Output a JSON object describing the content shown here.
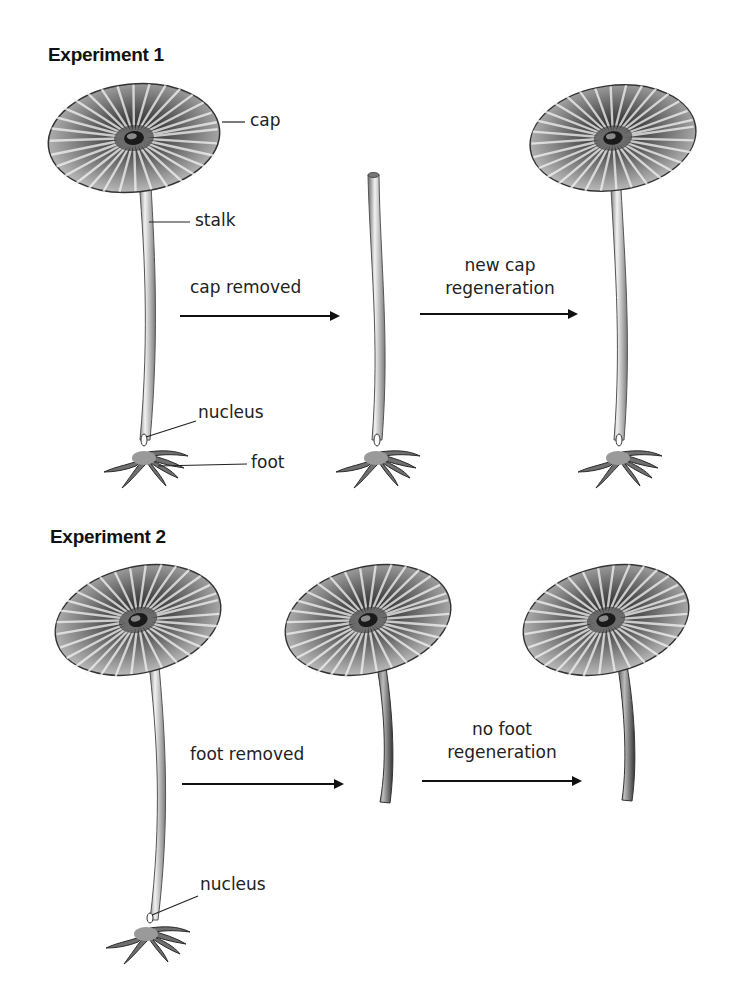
{
  "experiments": [
    {
      "title": "Experiment 1",
      "labels": {
        "cap": "cap",
        "stalk": "stalk",
        "nucleus": "nucleus",
        "foot": "foot"
      },
      "steps": [
        {
          "action": "cap removed"
        },
        {
          "action_line1": "new cap",
          "action_line2": "regeneration"
        }
      ],
      "stages": [
        "intact cell",
        "stalk and foot without cap",
        "regenerated cell with new cap"
      ]
    },
    {
      "title": "Experiment 2",
      "labels": {
        "nucleus": "nucleus"
      },
      "steps": [
        {
          "action": "foot removed"
        },
        {
          "action_line1": "no foot",
          "action_line2": "regeneration"
        }
      ],
      "stages": [
        "intact cell",
        "cap and stalk without foot",
        "cap and stalk, foot not regenerated"
      ]
    }
  ],
  "colors": {
    "ink": "#1a1a1a",
    "cap_dark": "#2b2b2b",
    "cap_light": "#d9d9d9",
    "stalk_fill": "#e8e8e8",
    "stalk_edge": "#555555"
  }
}
